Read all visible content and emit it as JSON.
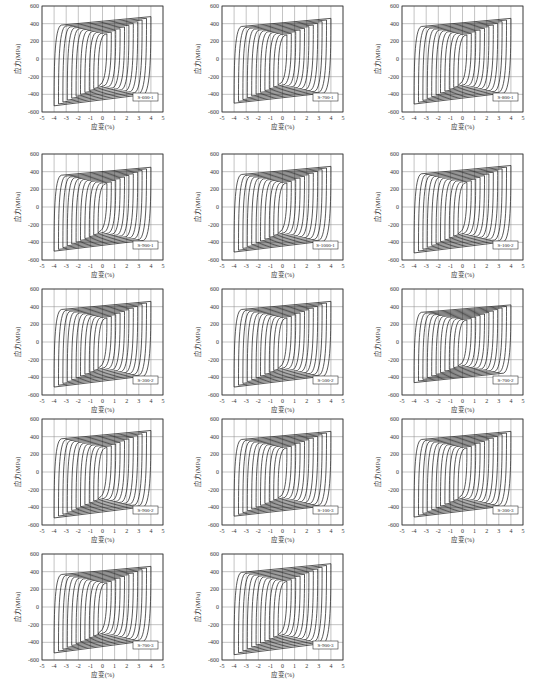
{
  "chart_data": [
    {
      "id": "S-600-1",
      "type": "line",
      "title": "S-600-1",
      "xlabel": "应变(%)",
      "ylabel": "应力(MPa)",
      "xlim": [
        -5,
        5
      ],
      "ylim": [
        -600,
        600
      ],
      "xticks": [
        -5,
        -4,
        -3,
        -2,
        -1,
        0,
        1,
        2,
        3,
        4,
        5
      ],
      "yticks": [
        -600,
        -400,
        -200,
        0,
        200,
        400,
        600
      ],
      "peak_pos": 480,
      "peak_neg": -530,
      "max_strain": 4,
      "grid": true
    },
    {
      "id": "S-700-1",
      "type": "line",
      "title": "S-700-1",
      "xlabel": "应变(%)",
      "ylabel": "应力(MPa)",
      "xlim": [
        -5,
        5
      ],
      "ylim": [
        -600,
        600
      ],
      "xticks": [
        -5,
        -4,
        -3,
        -2,
        -1,
        0,
        1,
        2,
        3,
        4,
        5
      ],
      "yticks": [
        -600,
        -400,
        -200,
        0,
        200,
        400,
        600
      ],
      "peak_pos": 460,
      "peak_neg": -500,
      "max_strain": 4,
      "grid": true
    },
    {
      "id": "S-800-1",
      "type": "line",
      "title": "S-800-1",
      "xlabel": "应变(%)",
      "ylabel": "应力(MPa)",
      "xlim": [
        -5,
        5
      ],
      "ylim": [
        -600,
        600
      ],
      "xticks": [
        -5,
        -4,
        -3,
        -2,
        -1,
        0,
        1,
        2,
        3,
        4,
        5
      ],
      "yticks": [
        -600,
        -400,
        -200,
        0,
        200,
        400,
        600
      ],
      "peak_pos": 460,
      "peak_neg": -510,
      "max_strain": 4,
      "grid": true
    },
    {
      "id": "S-900-1",
      "type": "line",
      "title": "S-900-1",
      "xlabel": "应变(%)",
      "ylabel": "应力(MPa)",
      "xlim": [
        -5,
        5
      ],
      "ylim": [
        -600,
        600
      ],
      "xticks": [
        -5,
        -4,
        -3,
        -2,
        -1,
        0,
        1,
        2,
        3,
        4,
        5
      ],
      "yticks": [
        -600,
        -400,
        -200,
        0,
        200,
        400,
        600
      ],
      "peak_pos": 450,
      "peak_neg": -500,
      "max_strain": 4,
      "grid": true
    },
    {
      "id": "S-1000-1",
      "type": "line",
      "title": "S-1000-1",
      "xlabel": "应变(%)",
      "ylabel": "应力(MPa)",
      "xlim": [
        -5,
        5
      ],
      "ylim": [
        -600,
        600
      ],
      "xticks": [
        -5,
        -4,
        -3,
        -2,
        -1,
        0,
        1,
        2,
        3,
        4,
        5
      ],
      "yticks": [
        -600,
        -400,
        -200,
        0,
        200,
        400,
        600
      ],
      "peak_pos": 460,
      "peak_neg": -510,
      "max_strain": 4,
      "grid": true
    },
    {
      "id": "S-100-2",
      "type": "line",
      "title": "S-100-2",
      "xlabel": "应变(%)",
      "ylabel": "应力(MPa)",
      "xlim": [
        -5,
        5
      ],
      "ylim": [
        -600,
        600
      ],
      "xticks": [
        -5,
        -4,
        -3,
        -2,
        -1,
        0,
        1,
        2,
        3,
        4,
        5
      ],
      "yticks": [
        -600,
        -400,
        -200,
        0,
        200,
        400,
        600
      ],
      "peak_pos": 470,
      "peak_neg": -520,
      "max_strain": 4,
      "grid": true
    },
    {
      "id": "S-300-2",
      "type": "line",
      "title": "S-300-2",
      "xlabel": "应变(%)",
      "ylabel": "应力(MPa)",
      "xlim": [
        -5,
        5
      ],
      "ylim": [
        -600,
        600
      ],
      "xticks": [
        -5,
        -4,
        -3,
        -2,
        -1,
        0,
        1,
        2,
        3,
        4,
        5
      ],
      "yticks": [
        -600,
        -400,
        -200,
        0,
        200,
        400,
        600
      ],
      "peak_pos": 460,
      "peak_neg": -510,
      "max_strain": 4,
      "grid": true
    },
    {
      "id": "S-500-2",
      "type": "line",
      "title": "S-500-2",
      "xlabel": "应变(%)",
      "ylabel": "应力(MPa)",
      "xlim": [
        -5,
        5
      ],
      "ylim": [
        -600,
        600
      ],
      "xticks": [
        -5,
        -4,
        -3,
        -2,
        -1,
        0,
        1,
        2,
        3,
        4,
        5
      ],
      "yticks": [
        -600,
        -400,
        -200,
        0,
        200,
        400,
        600
      ],
      "peak_pos": 460,
      "peak_neg": -510,
      "max_strain": 4,
      "grid": true
    },
    {
      "id": "S-700-2",
      "type": "line",
      "title": "S-700-2",
      "xlabel": "应变(%)",
      "ylabel": "应力(MPa)",
      "xlim": [
        -5,
        5
      ],
      "ylim": [
        -600,
        600
      ],
      "xticks": [
        -5,
        -4,
        -3,
        -2,
        -1,
        0,
        1,
        2,
        3,
        4,
        5
      ],
      "yticks": [
        -600,
        -400,
        -200,
        0,
        200,
        400,
        600
      ],
      "peak_pos": 420,
      "peak_neg": -460,
      "max_strain": 4,
      "grid": true
    },
    {
      "id": "S-900-2",
      "type": "line",
      "title": "S-900-2",
      "xlabel": "应变(%)",
      "ylabel": "应力(MPa)",
      "xlim": [
        -5,
        5
      ],
      "ylim": [
        -600,
        600
      ],
      "xticks": [
        -5,
        -4,
        -3,
        -2,
        -1,
        0,
        1,
        2,
        3,
        4,
        5
      ],
      "yticks": [
        -600,
        -400,
        -200,
        0,
        200,
        400,
        600
      ],
      "peak_pos": 470,
      "peak_neg": -520,
      "max_strain": 4,
      "grid": true
    },
    {
      "id": "S-100-3",
      "type": "line",
      "title": "S-100-3",
      "xlabel": "应变(%)",
      "ylabel": "应力(MPa)",
      "xlim": [
        -5,
        5
      ],
      "ylim": [
        -600,
        600
      ],
      "xticks": [
        -5,
        -4,
        -3,
        -2,
        -1,
        0,
        1,
        2,
        3,
        4,
        5
      ],
      "yticks": [
        -600,
        -400,
        -200,
        0,
        200,
        400,
        600
      ],
      "peak_pos": 460,
      "peak_neg": -500,
      "max_strain": 4,
      "grid": true
    },
    {
      "id": "S-300-3",
      "type": "line",
      "title": "S-300-3",
      "xlabel": "应变(%)",
      "ylabel": "应力(MPa)",
      "xlim": [
        -5,
        5
      ],
      "ylim": [
        -600,
        600
      ],
      "xticks": [
        -5,
        -4,
        -3,
        -2,
        -1,
        0,
        1,
        2,
        3,
        4,
        5
      ],
      "yticks": [
        -600,
        -400,
        -200,
        0,
        200,
        400,
        600
      ],
      "peak_pos": 460,
      "peak_neg": -510,
      "max_strain": 4,
      "grid": true
    },
    {
      "id": "S-700-3",
      "type": "line",
      "title": "S-700-3",
      "xlabel": "应变(%)",
      "ylabel": "应力(MPa)",
      "xlim": [
        -5,
        5
      ],
      "ylim": [
        -600,
        600
      ],
      "xticks": [
        -5,
        -4,
        -3,
        -2,
        -1,
        0,
        1,
        2,
        3,
        4,
        5
      ],
      "yticks": [
        -600,
        -400,
        -200,
        0,
        200,
        400,
        600
      ],
      "peak_pos": 460,
      "peak_neg": -520,
      "max_strain": 4,
      "grid": true
    },
    {
      "id": "S-900-3",
      "type": "line",
      "title": "S-900-3",
      "xlabel": "应变(%)",
      "ylabel": "应力(MPa)",
      "xlim": [
        -5,
        5
      ],
      "ylim": [
        -600,
        600
      ],
      "xticks": [
        -5,
        -4,
        -3,
        -2,
        -1,
        0,
        1,
        2,
        3,
        4,
        5
      ],
      "yticks": [
        -600,
        -400,
        -200,
        0,
        200,
        400,
        600
      ],
      "peak_pos": 490,
      "peak_neg": -540,
      "max_strain": 4,
      "grid": true
    }
  ],
  "layout": {
    "positions": [
      [
        0,
        0
      ],
      [
        180,
        0
      ],
      [
        360,
        0
      ],
      [
        0,
        148
      ],
      [
        180,
        148
      ],
      [
        360,
        148
      ],
      [
        0,
        283
      ],
      [
        180,
        283
      ],
      [
        360,
        283
      ],
      [
        0,
        413
      ],
      [
        180,
        413
      ],
      [
        360,
        413
      ],
      [
        0,
        548
      ],
      [
        180,
        548
      ]
    ]
  }
}
